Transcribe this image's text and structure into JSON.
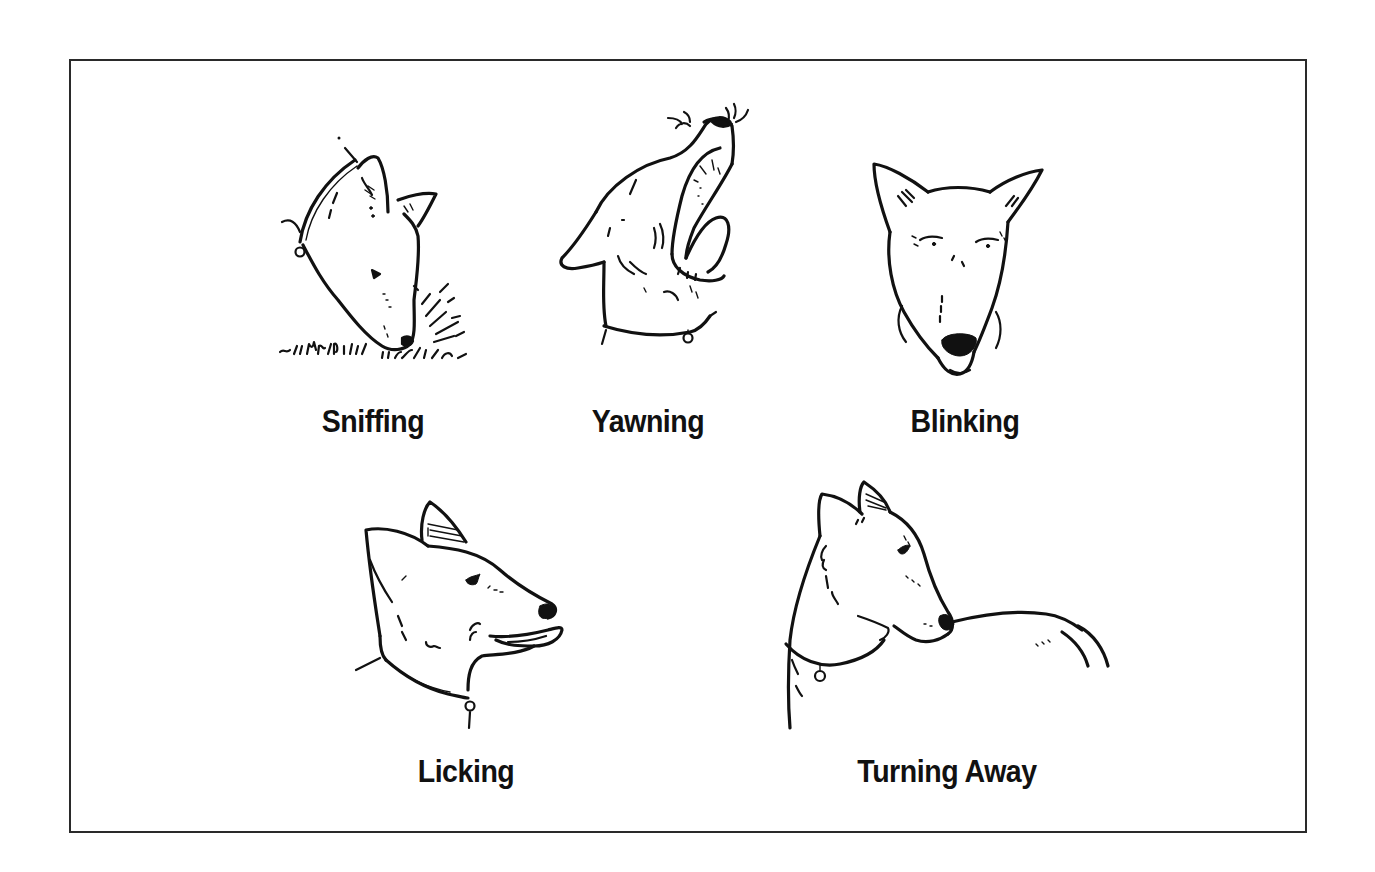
{
  "figure": {
    "border_color": "#2a2a2a",
    "panels": [
      {
        "id": "sniffing",
        "label": "Sniffing",
        "icon": "dog-sniffing-ground-illustration"
      },
      {
        "id": "yawning",
        "label": "Yawning",
        "icon": "dog-yawning-illustration"
      },
      {
        "id": "blinking",
        "label": "Blinking",
        "icon": "dog-blinking-illustration"
      },
      {
        "id": "licking",
        "label": "Licking",
        "icon": "dog-licking-lips-illustration"
      },
      {
        "id": "turning_away",
        "label": "Turning Away",
        "icon": "dog-turning-away-illustration"
      }
    ]
  }
}
